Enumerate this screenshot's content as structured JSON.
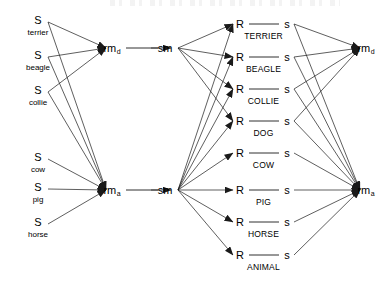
{
  "figure": {
    "name": "spreading-activation-semantic-network",
    "width": 392,
    "height": 287,
    "background_color": "#ffffff",
    "line_color": "#1a1a1a",
    "text_color": "#000000"
  },
  "stimulus_nodes": [
    {
      "id": "s-terrier",
      "symbol": "S",
      "label": "terrier",
      "x": 38,
      "y": 20,
      "sub_y": 33
    },
    {
      "id": "s-beagle",
      "symbol": "S",
      "label": "beagle",
      "x": 38,
      "y": 55,
      "sub_y": 68
    },
    {
      "id": "s-collie",
      "symbol": "S",
      "label": "collie",
      "x": 38,
      "y": 90,
      "sub_y": 103
    },
    {
      "id": "s-cow",
      "symbol": "S",
      "label": "cow",
      "x": 38,
      "y": 157,
      "sub_y": 170
    },
    {
      "id": "s-pig",
      "symbol": "S",
      "label": "pig",
      "x": 38,
      "y": 187,
      "sub_y": 200
    },
    {
      "id": "s-horse",
      "symbol": "S",
      "label": "horse",
      "x": 38,
      "y": 222,
      "sub_y": 235
    }
  ],
  "relay_modules": [
    {
      "id": "rm-d-left",
      "base": "rm",
      "subscript": "d",
      "x": 112,
      "y": 48,
      "side": "left"
    },
    {
      "id": "rm-a-left",
      "base": "rm",
      "subscript": "a",
      "x": 112,
      "y": 190,
      "side": "left"
    },
    {
      "id": "rm-d-right",
      "base": "rm",
      "subscript": "d",
      "x": 366,
      "y": 48,
      "side": "right"
    },
    {
      "id": "rm-a-right",
      "base": "rm",
      "subscript": "a",
      "x": 366,
      "y": 190,
      "side": "right"
    }
  ],
  "semantic_memory_nodes": [
    {
      "id": "sm-top",
      "label": "sm",
      "x": 165,
      "y": 48
    },
    {
      "id": "sm-bottom",
      "label": "sm",
      "x": 165,
      "y": 190
    }
  ],
  "concept_nodes": [
    {
      "id": "c-terrier",
      "left_symbol": "R",
      "right_symbol": "s",
      "label": "TERRIER",
      "y": 24,
      "label_y": 36,
      "group": "dog"
    },
    {
      "id": "c-beagle",
      "left_symbol": "R",
      "right_symbol": "s",
      "label": "BEAGLE",
      "y": 57,
      "label_y": 69,
      "group": "dog"
    },
    {
      "id": "c-collie",
      "left_symbol": "R",
      "right_symbol": "s",
      "label": "COLLIE",
      "y": 89,
      "label_y": 101,
      "group": "dog"
    },
    {
      "id": "c-dog",
      "left_symbol": "R",
      "right_symbol": "s",
      "label": "DOG",
      "y": 121,
      "label_y": 133,
      "group": "dog"
    },
    {
      "id": "c-cow",
      "left_symbol": "R",
      "right_symbol": "s",
      "label": "COW",
      "y": 153,
      "label_y": 165,
      "group": "animal"
    },
    {
      "id": "c-pig",
      "left_symbol": "R",
      "right_symbol": "s",
      "label": "PIG",
      "y": 190,
      "label_y": 202,
      "group": "animal"
    },
    {
      "id": "c-horse",
      "left_symbol": "R",
      "right_symbol": "s",
      "label": "HORSE",
      "y": 222,
      "label_y": 234,
      "group": "animal"
    },
    {
      "id": "c-animal",
      "left_symbol": "R",
      "right_symbol": "s",
      "label": "ANIMAL",
      "y": 255,
      "label_y": 267,
      "group": "animal"
    }
  ],
  "geometry": {
    "concept_R_x": 240,
    "concept_s_x": 287,
    "concept_bar_start": 249,
    "concept_bar_end": 279,
    "stimulus_anchor_x": 48,
    "rm_left_x": 106,
    "sm_left_x": 172,
    "sm_right_x": 178,
    "concept_left_anchor_x": 233,
    "concept_right_anchor_x": 294,
    "rm_right_x": 360
  },
  "edges_stimulus_to_rm": [
    {
      "from": "s-terrier",
      "to": "rm-d-left"
    },
    {
      "from": "s-beagle",
      "to": "rm-d-left"
    },
    {
      "from": "s-collie",
      "to": "rm-d-left"
    },
    {
      "from": "s-terrier",
      "to": "rm-a-left"
    },
    {
      "from": "s-beagle",
      "to": "rm-a-left"
    },
    {
      "from": "s-collie",
      "to": "rm-a-left"
    },
    {
      "from": "s-cow",
      "to": "rm-a-left"
    },
    {
      "from": "s-pig",
      "to": "rm-a-left"
    },
    {
      "from": "s-horse",
      "to": "rm-a-left"
    }
  ],
  "edges_rm_to_sm": [
    {
      "from": "rm-d-left",
      "to": "sm-top"
    },
    {
      "from": "rm-a-left",
      "to": "sm-bottom"
    }
  ],
  "edges_sm_to_concept": [
    {
      "from": "sm-top",
      "to": "c-terrier"
    },
    {
      "from": "sm-top",
      "to": "c-beagle"
    },
    {
      "from": "sm-top",
      "to": "c-collie"
    },
    {
      "from": "sm-top",
      "to": "c-dog"
    },
    {
      "from": "sm-bottom",
      "to": "c-terrier"
    },
    {
      "from": "sm-bottom",
      "to": "c-beagle"
    },
    {
      "from": "sm-bottom",
      "to": "c-collie"
    },
    {
      "from": "sm-bottom",
      "to": "c-dog"
    },
    {
      "from": "sm-bottom",
      "to": "c-cow"
    },
    {
      "from": "sm-bottom",
      "to": "c-pig"
    },
    {
      "from": "sm-bottom",
      "to": "c-horse"
    },
    {
      "from": "sm-bottom",
      "to": "c-animal"
    }
  ],
  "edges_concept_to_rm": [
    {
      "from": "c-terrier",
      "to": "rm-d-right"
    },
    {
      "from": "c-beagle",
      "to": "rm-d-right"
    },
    {
      "from": "c-collie",
      "to": "rm-d-right"
    },
    {
      "from": "c-dog",
      "to": "rm-d-right"
    },
    {
      "from": "c-terrier",
      "to": "rm-a-right"
    },
    {
      "from": "c-beagle",
      "to": "rm-a-right"
    },
    {
      "from": "c-collie",
      "to": "rm-a-right"
    },
    {
      "from": "c-dog",
      "to": "rm-a-right"
    },
    {
      "from": "c-cow",
      "to": "rm-a-right"
    },
    {
      "from": "c-pig",
      "to": "rm-a-right"
    },
    {
      "from": "c-horse",
      "to": "rm-a-right"
    },
    {
      "from": "c-animal",
      "to": "rm-a-right"
    }
  ]
}
